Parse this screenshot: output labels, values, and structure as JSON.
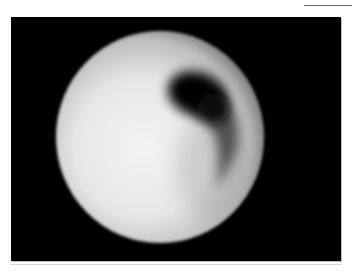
{
  "figure": {
    "colors": {
      "background": "#000000",
      "sphere_bright": "#f2f2f2",
      "sphere_edge": "#8a8a8a",
      "dark_region": "#050505"
    }
  }
}
